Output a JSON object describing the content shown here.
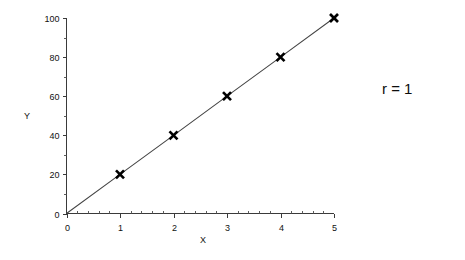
{
  "chart_data": {
    "type": "scatter",
    "title": "",
    "subtitle": "",
    "xlabel": "X",
    "ylabel": "Y",
    "xlim": [
      0,
      5
    ],
    "ylim": [
      0,
      100
    ],
    "grid": false,
    "legend": null,
    "x": [
      1,
      2,
      3,
      4,
      5
    ],
    "values": [
      20,
      40,
      60,
      80,
      100
    ],
    "series": [
      {
        "name": "",
        "x": [
          0,
          1,
          2,
          3,
          4,
          5
        ],
        "values": [
          0,
          20,
          40,
          60,
          80,
          100
        ],
        "marker": "x",
        "marker_color": "#000000",
        "line_color": "#444444",
        "line_through_origin": true
      }
    ],
    "x_ticks": [
      {
        "value": 0,
        "label": "0"
      },
      {
        "value": 1,
        "label": "1"
      },
      {
        "value": 2,
        "label": "2"
      },
      {
        "value": 3,
        "label": "3"
      },
      {
        "value": 4,
        "label": "4"
      },
      {
        "value": 5,
        "label": "5"
      }
    ],
    "x_minor_step": 0.2,
    "y_ticks": [
      {
        "value": 0,
        "label": "0"
      },
      {
        "value": 20,
        "label": "20"
      },
      {
        "value": 40,
        "label": "40"
      },
      {
        "value": 60,
        "label": "60"
      },
      {
        "value": 80,
        "label": "80"
      },
      {
        "value": 100,
        "label": "100"
      }
    ],
    "y_minor_step": 10,
    "annotations": [
      {
        "text": "r = 1",
        "x_px": 382,
        "y_px": 94
      }
    ],
    "colors": {
      "background": "#ffffff",
      "axis": "#3a3a3a",
      "line": "#444444",
      "marker": "#000000",
      "text": "#111111"
    }
  },
  "axis_titles": {
    "x": "X",
    "y": "Y"
  },
  "annotation": {
    "correlation_label": "r = 1"
  },
  "tick_labels": {
    "x": [
      "0",
      "1",
      "2",
      "3",
      "4",
      "5"
    ],
    "y": [
      "0",
      "20",
      "40",
      "60",
      "80",
      "100"
    ]
  }
}
